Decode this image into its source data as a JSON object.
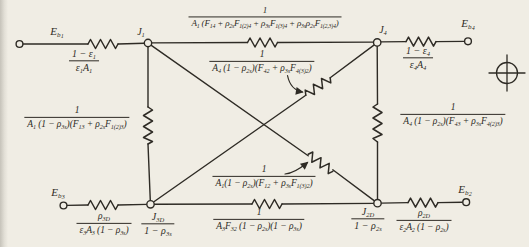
{
  "palette": {
    "page_bg": "#f0ede4",
    "ink": "#2e2b25",
    "edge_shadow": "#c6c3ba"
  },
  "nodes": {
    "eb1": "E_{b_{1}}",
    "j1": "J_{1}",
    "j4": "J_{4}",
    "eb4": "E_{b_{4}}",
    "eb3": "E_{b_{3}}",
    "eb2": "E_{b_{2}}",
    "j3d": {
      "num": "J_{3D}",
      "den": "1 − ρ_{3s}"
    },
    "j2d": {
      "num": "J_{2D}",
      "den": "1 − ρ_{2s}"
    }
  },
  "resistors": {
    "eb1_j1": {
      "num": "1 − ε_{1}",
      "den": "ε_{1}A_{1}"
    },
    "j1_j4": {
      "num": "1",
      "den": "A_{1} (F_{14} + ρ_{2s}F_{1(2)4} + ρ_{3s}F_{1(3)4} + ρ_{3s}ρ_{2s}F_{1(2,3)4})"
    },
    "j4_eb4": {
      "num": "1 − ε_{4}",
      "den": "ε_{4}A_{4}"
    },
    "j1_j3d": {
      "num": "1",
      "den": "A_{1} (1 − ρ_{3s})(F_{13} + ρ_{2s}F_{1(2)3})"
    },
    "j4_j2d": {
      "num": "1",
      "den": "A_{4} (1 − ρ_{2s})(F_{43} + ρ_{3s}F_{4(2)3})"
    },
    "j4_j3d": {
      "num": "1",
      "den": "A_{4} (1 − ρ_{2s})(F_{42} + ρ_{3s}F_{4(3)2})"
    },
    "j1_j2d": {
      "num": "1",
      "den": "A_{1}(1 − ρ_{2s})(F_{12} + ρ_{3s}F_{1(3)2})"
    },
    "j3d_j2d": {
      "num": "1",
      "den": "A_{3}F_{32} (1 − ρ_{2s})(1 − ρ_{3s})"
    },
    "eb3_j3d": {
      "num": "ρ_{3D}",
      "den": "ε_{3}A_{3} (1 − ρ_{3s})"
    },
    "j2d_eb2": {
      "num": "ρ_{2D}",
      "den": "ε_{2}A_{2} (1 − ρ_{2s})"
    }
  }
}
